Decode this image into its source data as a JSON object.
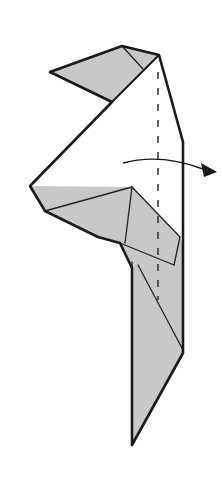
{
  "diagram": {
    "title": "",
    "type": "origami-fold-step",
    "colors": {
      "paper_back": "#ffffff",
      "paper_colored": "#c8c8c8",
      "outline": "#1a1a1a"
    },
    "shapes": {
      "body_outline": "M50,72 L122,46 L159,55 L183,142 L183,353 L132,445 L132,268 L120,243 L98,237 L45,211 L30,186 L112,102 Z",
      "white_face": "M112,102 L159,55 L183,142 L183,353 L183,247 L180,237 L132,187 L30,186 Z",
      "top_flap": "M50,72 L122,46 L159,55 L112,102 Z",
      "middle_flap": "M30,186 L132,187 L180,237 L174,265 L132,268 L120,243 L98,237 L45,211 Z",
      "lower_strip": "M132,265 L183,265 L183,353 L132,445 Z"
    },
    "creases": [
      "M122,46 L143,69",
      "M112,102 L159,55",
      "M45,211 L132,187",
      "M132,187 L125,243",
      "M120,243 L174,265",
      "M138,265 L183,350"
    ],
    "valley_fold_line": {
      "x": 158,
      "y1": 72,
      "y2": 300
    },
    "arrow": {
      "path": "M123,163 Q160,153 203,169",
      "head": "M217,172 L201,163 L204,177 Z",
      "direction": "fold-behind-right"
    },
    "labels": []
  }
}
